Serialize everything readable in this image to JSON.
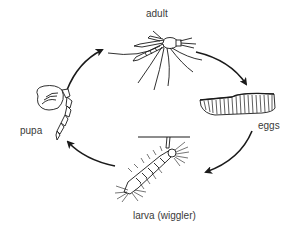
{
  "diagram": {
    "type": "life-cycle",
    "direction": "clockwise",
    "stages": [
      {
        "id": "adult",
        "label": "adult",
        "position": "top"
      },
      {
        "id": "eggs",
        "label": "eggs",
        "position": "right"
      },
      {
        "id": "larva",
        "label": "larva (wiggler)",
        "position": "bottom"
      },
      {
        "id": "pupa",
        "label": "pupa",
        "position": "left"
      }
    ],
    "arrows": [
      {
        "from": "adult",
        "to": "eggs"
      },
      {
        "from": "eggs",
        "to": "larva"
      },
      {
        "from": "larva",
        "to": "pupa"
      },
      {
        "from": "pupa",
        "to": "adult"
      }
    ],
    "colors": {
      "line": "#1a1a1a",
      "text": "#3a3a3a",
      "background": "#ffffff"
    }
  }
}
